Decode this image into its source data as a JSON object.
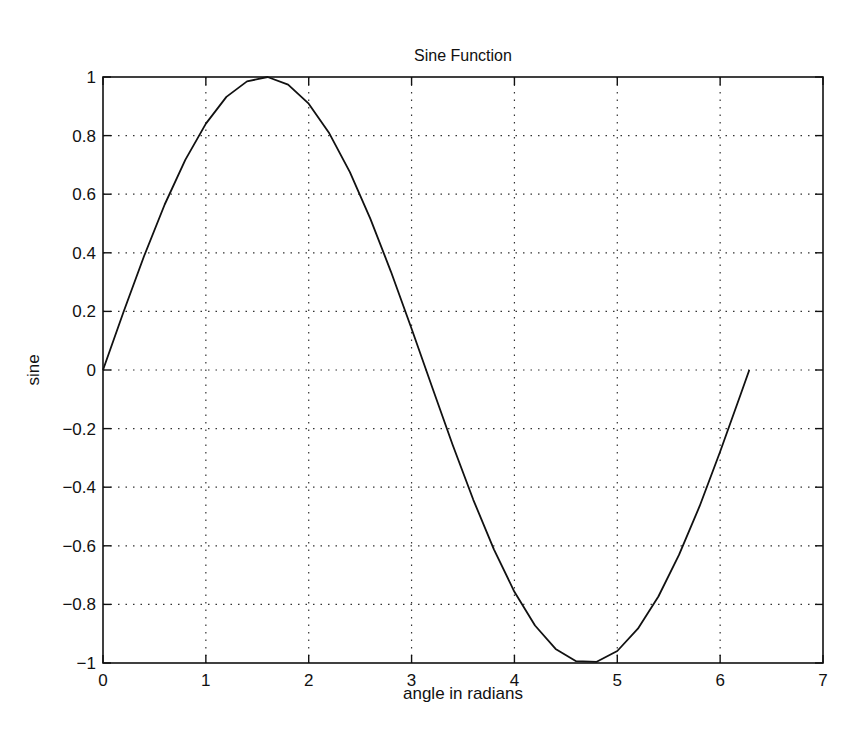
{
  "chart_data": {
    "type": "line",
    "title": "Sine Function",
    "xlabel": "angle in radians",
    "ylabel": "sine",
    "xlim": [
      0,
      7
    ],
    "ylim": [
      -1,
      1
    ],
    "grid": true,
    "legend": null,
    "x_ticks": [
      0,
      1,
      2,
      3,
      4,
      5,
      6,
      7
    ],
    "x_tick_labels": [
      "0",
      "1",
      "2",
      "3",
      "4",
      "5",
      "6",
      "7"
    ],
    "y_ticks": [
      -1,
      -0.8,
      -0.6,
      -0.4,
      -0.2,
      0,
      0.2,
      0.4,
      0.6,
      0.8,
      1
    ],
    "y_tick_labels": [
      "−1",
      "−0.8",
      "−0.6",
      "−0.4",
      "−0.2",
      "0",
      "0.2",
      "0.4",
      "0.6",
      "0.8",
      "1"
    ],
    "series": [
      {
        "name": "sin(x)",
        "color": "#111111",
        "x": [
          0,
          0.2,
          0.4,
          0.6,
          0.8,
          1.0,
          1.2,
          1.4,
          1.6,
          1.8,
          2.0,
          2.2,
          2.4,
          2.6,
          2.8,
          3.0,
          3.2,
          3.4,
          3.6,
          3.8,
          4.0,
          4.2,
          4.4,
          4.6,
          4.8,
          5.0,
          5.2,
          5.4,
          5.6,
          5.8,
          6.0,
          6.2,
          6.2832
        ],
        "y": [
          0,
          0.199,
          0.389,
          0.565,
          0.717,
          0.841,
          0.932,
          0.985,
          1.0,
          0.974,
          0.909,
          0.808,
          0.675,
          0.516,
          0.335,
          0.141,
          -0.058,
          -0.256,
          -0.443,
          -0.612,
          -0.757,
          -0.872,
          -0.952,
          -0.994,
          -0.996,
          -0.959,
          -0.883,
          -0.773,
          -0.631,
          -0.465,
          -0.279,
          -0.083,
          0
        ]
      }
    ]
  },
  "figure": {
    "title": "Sine Function",
    "xlabel": "angle in radians",
    "ylabel": "sine"
  }
}
